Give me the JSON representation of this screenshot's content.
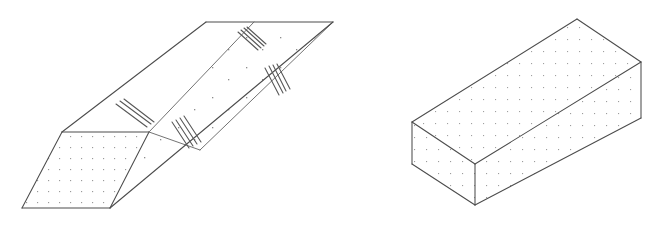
{
  "figure": {
    "title": "Two isometric solid line drawings",
    "background_color": "#ffffff",
    "line_color": "#4c4c4c",
    "stipple_color": "#8a8a8a",
    "tick_color": "#585858",
    "width": 657,
    "height": 225,
    "shapes": [
      {
        "id": "left-solid",
        "name": "elongated-wedge-prism",
        "description": "Long tapering prism seen in oblique view with a stippled parallelogram end face at lower left and a pointed wedge tip at upper right",
        "faces": [
          {
            "name": "end-face-parallelogram",
            "fill": "stippled",
            "points": "62,132 149,132 110,208 22,208"
          },
          {
            "name": "left-slanted-face",
            "fill": "plain",
            "points": "62,132 206,22 254,22 149,132"
          },
          {
            "name": "inner-trough-face",
            "fill": "plain",
            "points": "149,132 254,22 333,22 200,150"
          },
          {
            "name": "lower-right-face",
            "fill": "plain",
            "points": "110,208 149,132 200,150 333,22"
          }
        ],
        "edges": [
          "62,132 149,132",
          "149,132 110,208",
          "110,208 22,208",
          "22,208 62,132",
          "62,132 206,22",
          "206,22 254,22",
          "254,22 149,132",
          "254,22 333,22",
          "333,22 200,150",
          "200,150 149,132",
          "333,22 110,208"
        ],
        "tick_groups": [
          {
            "name": "tick-group-lower-left",
            "count": 3,
            "angle_deg": 38,
            "position": "near left slanted edge"
          },
          {
            "name": "tick-group-lower-middle",
            "count": 4,
            "angle_deg": 62,
            "position": "near trough edge"
          },
          {
            "name": "tick-group-upper-left",
            "count": 4,
            "angle_deg": 42,
            "position": "upper area of inner face"
          },
          {
            "name": "tick-group-upper-right",
            "count": 4,
            "angle_deg": 72,
            "position": "right area of inner face"
          }
        ]
      },
      {
        "id": "right-solid",
        "name": "rectangular-cuboid",
        "description": "Rectangular box drawn in isometric projection with all three visible faces stippled",
        "faces": [
          {
            "name": "top-face",
            "fill": "stippled",
            "points": "412,122 577,19 641,62 475,164"
          },
          {
            "name": "front-left-face",
            "fill": "stippled",
            "points": "412,122 475,164 475,205 412,164"
          },
          {
            "name": "front-right-face",
            "fill": "stippled",
            "points": "475,164 641,62 641,118 475,205"
          }
        ],
        "edges": [
          "412,122 577,19",
          "577,19 641,62",
          "641,62 475,164",
          "475,164 412,122",
          "412,122 412,164",
          "412,164 475,205",
          "475,205 475,164",
          "475,205 641,118",
          "641,118 641,62"
        ]
      }
    ]
  }
}
